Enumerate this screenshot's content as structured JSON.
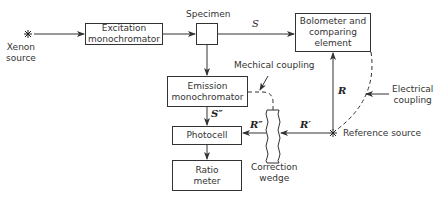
{
  "diagram": {
    "nodes": {
      "xenon": {
        "label_line1": "Xenon",
        "label_line2": "source"
      },
      "excitation": {
        "label": "Excitation monochromator"
      },
      "specimen": {
        "label": "Specimen"
      },
      "bolometer": {
        "label": "Bolometer and comparing element"
      },
      "emission": {
        "label": "Emission monochromator"
      },
      "photocell": {
        "label": "Photocell"
      },
      "ratio_meter": {
        "label": "Ratio meter"
      },
      "correction_wedge": {
        "label_line1": "Correction",
        "label_line2": "wedge"
      },
      "reference_source": {
        "label": "Reference source"
      }
    },
    "annotations": {
      "mechanical_coupling": "Mechical coupling",
      "electrical_coupling_line1": "Electrical",
      "electrical_coupling_line2": "coupling"
    },
    "signals": {
      "S": "S",
      "S_double_prime": "S″",
      "R": "R",
      "R_prime": "R′",
      "R_double_prime": "R″"
    },
    "colors": {
      "line": "#333333",
      "background": "#ffffff"
    }
  }
}
